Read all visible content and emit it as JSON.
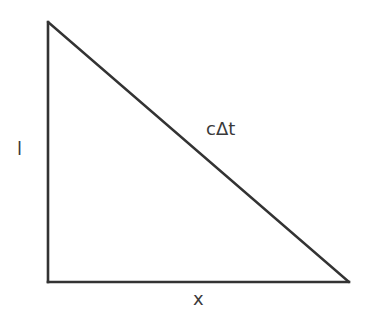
{
  "diagram": {
    "type": "right-triangle",
    "stroke_color": "#333333",
    "background": "#ffffff",
    "vertices": {
      "top": [
        48,
        22
      ],
      "right_angle": [
        48,
        282
      ],
      "right": [
        349,
        282
      ]
    },
    "labels": {
      "hypotenuse": "cΔt",
      "vertical_leg": "l",
      "horizontal_leg": "x"
    }
  }
}
